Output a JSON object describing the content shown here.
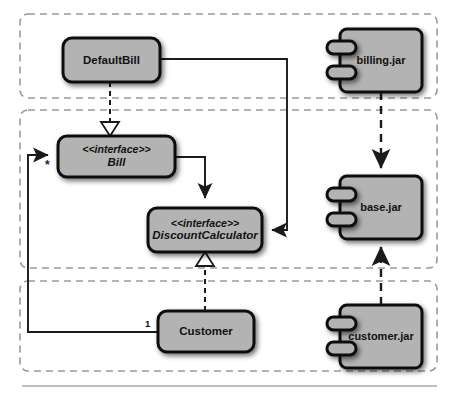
{
  "diagram": {
    "background_color": "#ffffff",
    "node_fill": "#b3b3b3",
    "node_stroke": "#111111",
    "partition_stroke": "#9a9a9a",
    "connector_stroke": "#1a1a1a",
    "baseline_rule_color": "#aaaaaa"
  },
  "partitions": [
    {
      "id": "partition-top",
      "x": 20,
      "y": 14,
      "w": 417,
      "h": 84
    },
    {
      "id": "partition-middle",
      "x": 20,
      "y": 110,
      "w": 417,
      "h": 158
    },
    {
      "id": "partition-bottom",
      "x": 20,
      "y": 281,
      "w": 417,
      "h": 90
    }
  ],
  "classes": [
    {
      "id": "default-bill",
      "name": "DefaultBill",
      "kind": "class",
      "x": 63,
      "y": 38,
      "w": 97,
      "h": 44
    },
    {
      "id": "bill",
      "name": "Bill",
      "stereotype": "<<interface>>",
      "kind": "interface",
      "x": 58,
      "y": 136,
      "w": 117,
      "h": 41
    },
    {
      "id": "discount-calculator",
      "name": "DiscountCalculator",
      "stereotype": "<<interface>>",
      "kind": "interface",
      "x": 148,
      "y": 208,
      "w": 114,
      "h": 44
    },
    {
      "id": "customer",
      "name": "Customer",
      "kind": "class",
      "x": 158,
      "y": 311,
      "w": 96,
      "h": 41
    }
  ],
  "components": [
    {
      "id": "billing-jar",
      "name": "billing.jar",
      "x": 340,
      "y": 29,
      "w": 82,
      "h": 63
    },
    {
      "id": "base-jar",
      "name": "base.jar",
      "x": 340,
      "y": 176,
      "w": 82,
      "h": 63
    },
    {
      "id": "customer-jar",
      "name": "customer.jar",
      "x": 340,
      "y": 305,
      "w": 82,
      "h": 63
    }
  ],
  "multiplicities": [
    {
      "id": "mult-star",
      "label": "*",
      "x": 45,
      "y": 159
    },
    {
      "id": "mult-one",
      "label": "1",
      "x": 145,
      "y": 318
    }
  ],
  "relationships": [
    {
      "id": "rel-defaultbill-realizes-bill",
      "type": "realization",
      "from": "default-bill",
      "to": "bill"
    },
    {
      "id": "rel-customer-realizes-discountcalc",
      "type": "realization",
      "from": "customer",
      "to": "discount-calculator"
    },
    {
      "id": "rel-bill-uses-discountcalc",
      "type": "association",
      "from": "bill",
      "to": "discount-calculator"
    },
    {
      "id": "rel-defaultbill-uses-discountcalc",
      "type": "association",
      "from": "default-bill",
      "to": "discount-calculator"
    },
    {
      "id": "rel-customer-has-bill",
      "type": "association",
      "from": "customer",
      "to": "bill"
    },
    {
      "id": "rel-billingjar-depends-basejar",
      "type": "dependency",
      "from": "billing-jar",
      "to": "base-jar"
    },
    {
      "id": "rel-customerjar-depends-basejar",
      "type": "dependency",
      "from": "customer-jar",
      "to": "base-jar"
    }
  ]
}
